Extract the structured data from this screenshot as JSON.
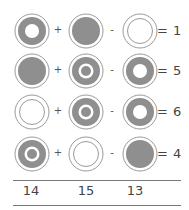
{
  "colors": {
    "fill": "#8f8f8f",
    "outline": "#9a9a9a",
    "text": "#444444",
    "rule": "#777777"
  },
  "legend": {
    "donut": "gray ring with white center",
    "solid": "solid gray disc",
    "empty": "white disc with thin inner ring",
    "target": "gray ring, white ring, gray center dot"
  },
  "rows": [
    {
      "cells": [
        "donut",
        "solid",
        "empty"
      ],
      "op1": "+",
      "op2": "-",
      "result": "= 1"
    },
    {
      "cells": [
        "solid",
        "target",
        "donut"
      ],
      "op1": "+",
      "op2": "-",
      "result": "= 5"
    },
    {
      "cells": [
        "empty",
        "target",
        "donut"
      ],
      "op1": "+",
      "op2": "-",
      "result": "= 6"
    },
    {
      "cells": [
        "target",
        "empty",
        "solid"
      ],
      "op1": "+",
      "op2": "-",
      "result": "= 4"
    }
  ],
  "answers": [
    "14",
    "15",
    "13"
  ]
}
